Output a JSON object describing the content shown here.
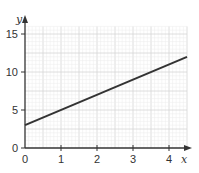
{
  "chart_data": {
    "type": "line",
    "title": "",
    "xlabel": "x",
    "ylabel": "y",
    "xlim": [
      0,
      4.5
    ],
    "ylim": [
      0,
      16
    ],
    "x_ticks": [
      0,
      1,
      2,
      3,
      4
    ],
    "y_ticks": [
      0,
      5,
      10,
      15
    ],
    "grid": true,
    "legend": null,
    "series": [
      {
        "name": "line",
        "x": [
          0,
          4.5
        ],
        "y": [
          3,
          12
        ],
        "equation": "y = 2x + 3",
        "color": "#333333"
      }
    ]
  },
  "labels": {
    "x_axis": "x",
    "y_axis": "y",
    "x_ticks": [
      "0",
      "1",
      "2",
      "3",
      "4"
    ],
    "y_ticks": [
      "0",
      "5",
      "10",
      "15"
    ]
  },
  "colors": {
    "grid_minor": "#ececec",
    "grid_major": "#d6d6d6",
    "axis": "#333333",
    "line": "#333333"
  }
}
